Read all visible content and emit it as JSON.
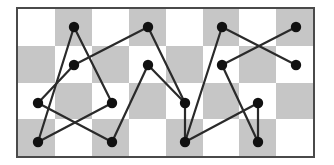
{
  "figure": {
    "caption": "",
    "background_color": "#ffffff"
  },
  "board": {
    "name": "checkerboard",
    "origin_x": 18,
    "origin_y": 9,
    "columns": 8,
    "rows": 4,
    "cell_width": 36.9,
    "cell_height": 36.8,
    "light_color": "#ffffff",
    "dark_color": "#c6c6c6",
    "border_color": "#4a4a4a",
    "border_width": 2,
    "parity_note": "cell is dark when (col + row) is odd"
  },
  "graph": {
    "node_color": "#111111",
    "node_radius": 5.2,
    "edge_color": "#2a2a2a",
    "edge_width": 2.2,
    "node_count": 16,
    "edge_count": 16,
    "nodes": [
      {
        "id": "n1",
        "label": "1",
        "x": 74,
        "y": 27
      },
      {
        "id": "n2",
        "label": "2",
        "x": 74,
        "y": 65
      },
      {
        "id": "n3",
        "label": "3",
        "x": 38,
        "y": 103
      },
      {
        "id": "n4",
        "label": "4",
        "x": 38,
        "y": 142
      },
      {
        "id": "n5",
        "label": "5",
        "x": 112,
        "y": 103
      },
      {
        "id": "n6",
        "label": "6",
        "x": 112,
        "y": 142
      },
      {
        "id": "n7",
        "label": "7",
        "x": 148,
        "y": 27
      },
      {
        "id": "n8",
        "label": "8",
        "x": 148,
        "y": 65
      },
      {
        "id": "n9",
        "label": "9",
        "x": 185,
        "y": 103
      },
      {
        "id": "n10",
        "label": "10",
        "x": 185,
        "y": 142
      },
      {
        "id": "n11",
        "label": "11",
        "x": 222,
        "y": 27
      },
      {
        "id": "n12",
        "label": "12",
        "x": 222,
        "y": 65
      },
      {
        "id": "n13",
        "label": "13",
        "x": 258,
        "y": 103
      },
      {
        "id": "n14",
        "label": "14",
        "x": 258,
        "y": 142
      },
      {
        "id": "n15",
        "label": "15",
        "x": 296,
        "y": 27
      },
      {
        "id": "n16",
        "label": "16",
        "x": 296,
        "y": 65
      }
    ],
    "edges": [
      {
        "from": "n1",
        "to": "n4"
      },
      {
        "from": "n1",
        "to": "n5"
      },
      {
        "from": "n2",
        "to": "n3"
      },
      {
        "from": "n2",
        "to": "n7"
      },
      {
        "from": "n3",
        "to": "n6"
      },
      {
        "from": "n4",
        "to": "n5"
      },
      {
        "from": "n6",
        "to": "n8"
      },
      {
        "from": "n7",
        "to": "n9"
      },
      {
        "from": "n8",
        "to": "n9"
      },
      {
        "from": "n10",
        "to": "n9"
      },
      {
        "from": "n10",
        "to": "n13"
      },
      {
        "from": "n11",
        "to": "n10"
      },
      {
        "from": "n11",
        "to": "n16"
      },
      {
        "from": "n12",
        "to": "n15"
      },
      {
        "from": "n12",
        "to": "n14"
      },
      {
        "from": "n13",
        "to": "n14"
      }
    ]
  }
}
